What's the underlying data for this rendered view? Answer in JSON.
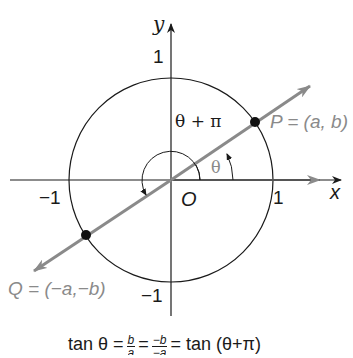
{
  "diagram": {
    "axes": {
      "x_label": "x",
      "y_label": "y",
      "origin_label": "O",
      "x_ticks": [
        "−1",
        "1"
      ],
      "y_ticks": [
        "1",
        "−1"
      ]
    },
    "circle": {
      "label": "unit circle",
      "radius": 1
    },
    "points": {
      "P": {
        "label": "P = (a, b)"
      },
      "Q": {
        "label": "Q = (−a,−b)"
      }
    },
    "angles": {
      "theta": "θ",
      "theta_plus_pi": "θ + π"
    },
    "formula": {
      "lhs": "tan θ",
      "eq1": "=",
      "frac1_num": "b",
      "frac1_den": "a",
      "eq2": "=",
      "frac2_num": "−b",
      "frac2_den": "−a",
      "eq3": "=",
      "rhs": "tan (θ+π)"
    },
    "colors": {
      "axes": "#1a1a1a",
      "line": "#8a8a8a",
      "points": "#111111",
      "labels_grey": "#8a8a8a"
    }
  }
}
